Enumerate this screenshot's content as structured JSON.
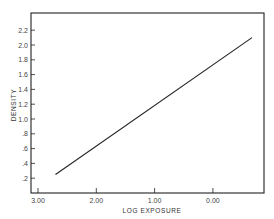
{
  "chart_data": {
    "type": "line",
    "title": "",
    "xlabel": "LOG EXPOSURE",
    "ylabel": "DENSITY",
    "x_reversed": true,
    "xlim": [
      3.1,
      -0.88
    ],
    "ylim": [
      0,
      2.4
    ],
    "x_ticks": [
      3.0,
      2.0,
      1.0,
      0.0
    ],
    "x_tick_labels": [
      "3.00",
      "2.00",
      "1.00",
      "0.00"
    ],
    "y_ticks": [
      0.2,
      0.4,
      0.6,
      0.8,
      1.0,
      1.2,
      1.4,
      1.6,
      1.8,
      2.0,
      2.2
    ],
    "y_tick_labels": [
      ".2",
      ".4",
      ".6",
      ".8",
      "1.0",
      "1.2",
      "1.4",
      "1.6",
      "1.8",
      "2.0",
      "2.2"
    ],
    "grid": false,
    "legend": null,
    "series": [
      {
        "name": "characteristic curve",
        "x": [
          2.7,
          -0.67
        ],
        "y": [
          0.25,
          2.1
        ]
      }
    ]
  },
  "colors": {
    "axis": "#222222",
    "line": "#222222",
    "background": "#ffffff"
  }
}
